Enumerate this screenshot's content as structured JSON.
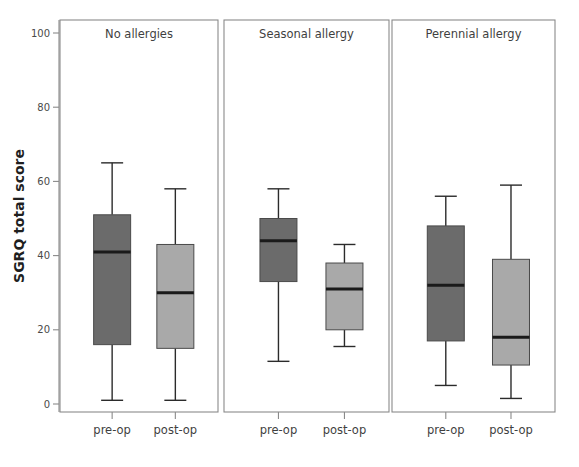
{
  "chart_data": {
    "type": "box",
    "title": "",
    "xlabel": "",
    "ylabel": "SGRQ total score",
    "ylim": [
      0,
      105
    ],
    "yticks": [
      0,
      20,
      40,
      60,
      80,
      100
    ],
    "ytick_labels": [
      "0",
      "20",
      "40",
      "60",
      "80",
      "100"
    ],
    "grid": false,
    "legend": "none",
    "panels": [
      {
        "label": "No allergies",
        "categories": [
          "pre-op",
          "post-op"
        ],
        "boxes": [
          {
            "name": "pre-op",
            "color": "#6b6b6b",
            "whisker_low": 1,
            "q1": 16,
            "median": 41,
            "q3": 51,
            "whisker_high": 65
          },
          {
            "name": "post-op",
            "color": "#a9a9a9",
            "whisker_low": 1,
            "q1": 15,
            "median": 30,
            "q3": 43,
            "whisker_high": 58
          }
        ]
      },
      {
        "label": "Seasonal allergy",
        "categories": [
          "pre-op",
          "post-op"
        ],
        "boxes": [
          {
            "name": "pre-op",
            "color": "#6b6b6b",
            "whisker_low": 11.5,
            "q1": 33,
            "median": 44,
            "q3": 50,
            "whisker_high": 58
          },
          {
            "name": "post-op",
            "color": "#a9a9a9",
            "whisker_low": 15.5,
            "q1": 20,
            "median": 31,
            "q3": 38,
            "whisker_high": 43
          }
        ]
      },
      {
        "label": "Perennial allergy",
        "categories": [
          "pre-op",
          "post-op"
        ],
        "boxes": [
          {
            "name": "pre-op",
            "color": "#6b6b6b",
            "whisker_low": 5,
            "q1": 17,
            "median": 32,
            "q3": 48,
            "whisker_high": 56
          },
          {
            "name": "post-op",
            "color": "#a9a9a9",
            "whisker_low": 1.5,
            "q1": 10.5,
            "median": 18,
            "q3": 39,
            "whisker_high": 59
          }
        ]
      }
    ],
    "colors": {
      "preop_fill": "#6b6b6b",
      "postop_fill": "#a9a9a9",
      "frame": "#8a8a8a",
      "median": "#1a1a1a",
      "whisker": "#2b2b2b",
      "background": "#ffffff"
    }
  }
}
